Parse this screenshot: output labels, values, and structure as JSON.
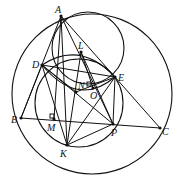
{
  "diagram": {
    "type": "geometry-figure",
    "points": {
      "A": {
        "x": 61,
        "y": 16,
        "label": "A",
        "lx": 55,
        "ly": 13
      },
      "L": {
        "x": 81,
        "y": 52,
        "label": "L",
        "lx": 78,
        "ly": 49
      },
      "D": {
        "x": 42,
        "y": 65,
        "label": "D",
        "lx": 32,
        "ly": 68
      },
      "E": {
        "x": 115,
        "y": 77,
        "label": "E",
        "lx": 118,
        "ly": 81
      },
      "N": {
        "x": 76,
        "y": 92,
        "label": "N",
        "lx": 78,
        "ly": 89
      },
      "O": {
        "x": 93,
        "y": 88,
        "label": "O",
        "lx": 90,
        "ly": 99
      },
      "B": {
        "x": 21,
        "y": 118,
        "label": "B",
        "lx": 11,
        "ly": 123
      },
      "M": {
        "x": 54,
        "y": 119,
        "label": "M",
        "lx": 47,
        "ly": 131
      },
      "P": {
        "x": 113,
        "y": 124,
        "label": "P",
        "lx": 111,
        "ly": 136
      },
      "C": {
        "x": 160,
        "y": 128,
        "label": "C",
        "lx": 162,
        "ly": 135
      },
      "K": {
        "x": 67,
        "y": 145,
        "label": "K",
        "lx": 60,
        "ly": 157
      }
    },
    "segments": [
      [
        "A",
        "B"
      ],
      [
        "A",
        "C"
      ],
      [
        "B",
        "C"
      ],
      [
        "A",
        "M"
      ],
      [
        "A",
        "P"
      ],
      [
        "A",
        "K"
      ],
      [
        "D",
        "E"
      ],
      [
        "D",
        "P"
      ],
      [
        "D",
        "K"
      ],
      [
        "E",
        "P"
      ],
      [
        "E",
        "K"
      ],
      [
        "K",
        "P"
      ],
      [
        "L",
        "P"
      ],
      [
        "L",
        "O"
      ],
      [
        "D",
        "N"
      ],
      [
        "N",
        "E"
      ],
      [
        "K",
        "L"
      ],
      [
        "B",
        "D"
      ]
    ],
    "circles": [
      {
        "name": "circumcircle-ABC",
        "cx": 92,
        "cy": 94,
        "r": 80
      },
      {
        "name": "circle-ADE-top",
        "cx": 88,
        "cy": 48,
        "r": 36
      },
      {
        "name": "circle-DEPK",
        "cx": 79,
        "cy": 103,
        "r": 44
      }
    ],
    "arcs": [
      {
        "name": "arc-DE-lower",
        "d": "M42 65 Q78 108 115 77"
      },
      {
        "name": "arc-DE-upper",
        "d": "M42 65 Q80 40 115 77"
      }
    ],
    "right_angles": [
      {
        "at": "M",
        "x": 50,
        "y": 114
      },
      {
        "at": "N",
        "x": 87,
        "y": 82
      }
    ]
  }
}
